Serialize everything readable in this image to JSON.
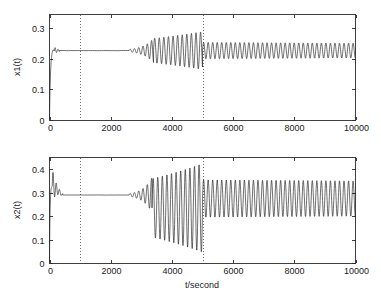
{
  "figure": {
    "width": 381,
    "height": 302,
    "background": "#ffffff",
    "line_color": "#1f1f1f",
    "axis_color": "#2a2a2a",
    "ref_line_color": "#4a4a4a"
  },
  "chart_data": [
    {
      "type": "line",
      "panel": "top",
      "title": "",
      "xlabel": "",
      "ylabel": "x1(t)",
      "xlim": [
        0,
        10000
      ],
      "ylim": [
        0,
        0.345
      ],
      "xticks": [
        0,
        2000,
        4000,
        6000,
        8000,
        10000
      ],
      "xticklabels": [
        "0",
        "2000",
        "4000",
        "6000",
        "8000",
        "10000"
      ],
      "yticks": [
        0,
        0.1,
        0.2,
        0.3
      ],
      "yticklabels": [
        "0",
        "0.1",
        "0.2",
        "0.3"
      ],
      "grid": false,
      "legend": null,
      "annotations": [
        {
          "type": "vline",
          "x": 1000,
          "style": "dotted",
          "label": ""
        },
        {
          "type": "vline",
          "x": 5000,
          "style": "dotted",
          "label": ""
        }
      ],
      "series": [
        {
          "name": "x1",
          "description": "Fast rise from 0 to about 0.227 with small overshoot, flat plateau, slowly growing oscillation from t=2700 peaking near amplitude 0.06 at t=4000-5000, abrupt reduction at t=5000 to a sustained oscillation of amplitude 0.025 about 0.227.",
          "baseline": 0.227,
          "segments": [
            {
              "t_start": 0,
              "t_end": 160,
              "mode": "rise",
              "y_from": 0.0,
              "y_to": 0.227,
              "amplitude": 0.0,
              "overshoot": 0.012,
              "period": 90
            },
            {
              "t_start": 160,
              "t_end": 320,
              "mode": "damped_ring",
              "y_from": 0.227,
              "y_to": 0.227,
              "amplitude": 0.012,
              "period": 95,
              "decay": 110
            },
            {
              "t_start": 320,
              "t_end": 2600,
              "mode": "flat",
              "y_from": 0.227,
              "y_to": 0.227,
              "amplitude": 0.0,
              "period": 0
            },
            {
              "t_start": 2600,
              "t_end": 3400,
              "mode": "growing_osc",
              "y_from": 0.227,
              "y_to": 0.227,
              "amplitude_start": 0.004,
              "amplitude_end": 0.04,
              "period": 140
            },
            {
              "t_start": 3400,
              "t_end": 5000,
              "mode": "growing_osc",
              "y_from": 0.227,
              "y_to": 0.227,
              "amplitude_start": 0.04,
              "amplitude_end": 0.062,
              "period": 150
            },
            {
              "t_start": 5000,
              "t_end": 10000,
              "mode": "steady_osc",
              "y_from": 0.227,
              "y_to": 0.227,
              "amplitude_start": 0.027,
              "amplitude_end": 0.024,
              "period": 148
            }
          ]
        }
      ]
    },
    {
      "type": "line",
      "panel": "bottom",
      "title": "",
      "xlabel": "t/second",
      "ylabel": "x2(t)",
      "xlim": [
        0,
        10000
      ],
      "ylim": [
        0,
        0.45
      ],
      "xticks": [
        0,
        2000,
        4000,
        6000,
        8000,
        10000
      ],
      "xticklabels": [
        "0",
        "2000",
        "4000",
        "6000",
        "8000",
        "10000"
      ],
      "yticks": [
        0,
        0.1,
        0.2,
        0.3,
        0.4
      ],
      "yticklabels": [
        "0",
        "0.1",
        "0.2",
        "0.3",
        "0.4"
      ],
      "grid": false,
      "legend": null,
      "annotations": [
        {
          "type": "vline",
          "x": 1000,
          "style": "dotted",
          "label": ""
        },
        {
          "type": "vline",
          "x": 5000,
          "style": "dotted",
          "label": ""
        }
      ],
      "series": [
        {
          "name": "x2",
          "description": "Initial damped ringing transient overshooting to 0.36 and dipping to 0.23, settling to 0.29 by t=400, flat plateau, growing oscillation from t=2700 reaching 0.04 to 0.42 by t=4000-5000, abrupt reduction at t=5000 to sustained oscillation between 0.20 and 0.35.",
          "baseline": 0.29,
          "segments": [
            {
              "t_start": 0,
              "t_end": 90,
              "mode": "rise",
              "y_from": 0.0,
              "y_to": 0.33,
              "amplitude": 0.0,
              "period": 60
            },
            {
              "t_start": 90,
              "t_end": 430,
              "mode": "damped_ring",
              "y_from": 0.33,
              "y_to": 0.29,
              "amplitude": 0.072,
              "period": 105,
              "decay": 130
            },
            {
              "t_start": 430,
              "t_end": 2600,
              "mode": "flat",
              "y_from": 0.29,
              "y_to": 0.29,
              "amplitude": 0.0,
              "period": 0
            },
            {
              "t_start": 2600,
              "t_end": 3350,
              "mode": "growing_osc",
              "y_from": 0.29,
              "y_to": 0.29,
              "amplitude_start": 0.006,
              "amplitude_end": 0.075,
              "period": 140
            },
            {
              "t_start": 3350,
              "t_end": 5000,
              "mode": "growing_osc",
              "y_from": 0.235,
              "y_to": 0.235,
              "amplitude_start": 0.125,
              "amplitude_end": 0.19,
              "period": 150
            },
            {
              "t_start": 5000,
              "t_end": 10000,
              "mode": "steady_osc",
              "y_from": 0.275,
              "y_to": 0.275,
              "amplitude_start": 0.08,
              "amplitude_end": 0.075,
              "period": 148
            }
          ]
        }
      ]
    }
  ]
}
